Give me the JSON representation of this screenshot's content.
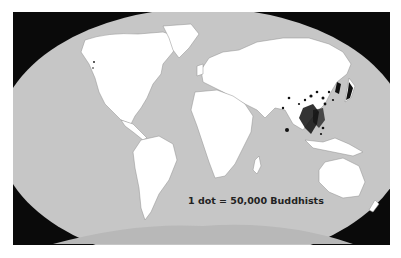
{
  "map": {
    "title": "",
    "projection": "Robinson-like elliptical world map",
    "legend_text": "1 dot = 50,000 Buddhists",
    "colors": {
      "background": "#0a0a0a",
      "ocean": "#c6c6c6",
      "land": "#ffffff",
      "borders": "#9a9a9a",
      "dots": "#111111",
      "antarctica": "#b8b8b8"
    },
    "concentrations": [
      "Southeast Asia (Myanmar, Thailand, Cambodia, Laos, Vietnam)",
      "China",
      "Japan",
      "Korea",
      "Sri Lanka",
      "Tibet / Himalaya"
    ]
  }
}
